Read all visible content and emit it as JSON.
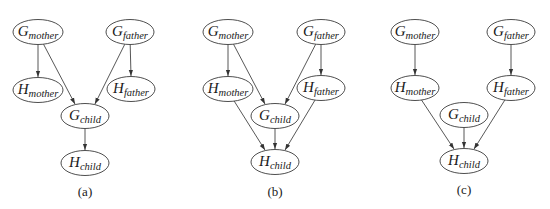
{
  "style": {
    "node_stroke": "#3a3a3a",
    "edge_color": "#444444",
    "background": "#ffffff"
  },
  "panels": [
    {
      "caption": "(a)",
      "caption_pos": [
        85,
        196
      ],
      "nodes": [
        {
          "id": "G_mother",
          "main": "G",
          "sub": "mother",
          "cx": 38,
          "cy": 32,
          "rx": 25,
          "ry": 12.5
        },
        {
          "id": "G_father",
          "main": "G",
          "sub": "father",
          "cx": 130,
          "cy": 32,
          "rx": 24,
          "ry": 12.5
        },
        {
          "id": "H_mother",
          "main": "H",
          "sub": "mother",
          "cx": 38,
          "cy": 90,
          "rx": 25,
          "ry": 12.5
        },
        {
          "id": "H_father",
          "main": "H",
          "sub": "father",
          "cx": 131,
          "cy": 89,
          "rx": 24,
          "ry": 12.5
        },
        {
          "id": "G_child",
          "main": "G",
          "sub": "child",
          "cx": 85,
          "cy": 116,
          "rx": 24,
          "ry": 12.5
        },
        {
          "id": "H_child",
          "main": "H",
          "sub": "child",
          "cx": 85,
          "cy": 163,
          "rx": 24,
          "ry": 12.5
        }
      ],
      "edges": [
        [
          "G_mother",
          "H_mother"
        ],
        [
          "G_father",
          "H_father"
        ],
        [
          "G_mother",
          "G_child"
        ],
        [
          "G_father",
          "G_child"
        ],
        [
          "G_child",
          "H_child"
        ]
      ]
    },
    {
      "caption": "(b)",
      "caption_pos": [
        275,
        196
      ],
      "nodes": [
        {
          "id": "G_mother",
          "main": "G",
          "sub": "mother",
          "cx": 228,
          "cy": 32,
          "rx": 25,
          "ry": 12.5
        },
        {
          "id": "G_father",
          "main": "G",
          "sub": "father",
          "cx": 321,
          "cy": 32,
          "rx": 24,
          "ry": 12.5
        },
        {
          "id": "H_mother",
          "main": "H",
          "sub": "mother",
          "cx": 228,
          "cy": 89,
          "rx": 25,
          "ry": 12.5
        },
        {
          "id": "H_father",
          "main": "H",
          "sub": "father",
          "cx": 321,
          "cy": 88,
          "rx": 24,
          "ry": 12.5
        },
        {
          "id": "G_child",
          "main": "G",
          "sub": "child",
          "cx": 275,
          "cy": 116,
          "rx": 24,
          "ry": 12.5
        },
        {
          "id": "H_child",
          "main": "H",
          "sub": "child",
          "cx": 275,
          "cy": 162,
          "rx": 24,
          "ry": 12.5
        }
      ],
      "edges": [
        [
          "G_mother",
          "H_mother"
        ],
        [
          "G_father",
          "H_father"
        ],
        [
          "G_mother",
          "G_child"
        ],
        [
          "G_father",
          "G_child"
        ],
        [
          "H_mother",
          "H_child"
        ],
        [
          "G_child",
          "H_child"
        ],
        [
          "H_father",
          "H_child"
        ]
      ]
    },
    {
      "caption": "(c)",
      "caption_pos": [
        464,
        194
      ],
      "nodes": [
        {
          "id": "G_mother",
          "main": "G",
          "sub": "mother",
          "cx": 415,
          "cy": 32,
          "rx": 24,
          "ry": 12.5
        },
        {
          "id": "G_father",
          "main": "G",
          "sub": "father",
          "cx": 511,
          "cy": 32,
          "rx": 24,
          "ry": 12.5
        },
        {
          "id": "H_mother",
          "main": "H",
          "sub": "mother",
          "cx": 415,
          "cy": 88,
          "rx": 24,
          "ry": 12.5
        },
        {
          "id": "H_father",
          "main": "H",
          "sub": "father",
          "cx": 511,
          "cy": 88,
          "rx": 24,
          "ry": 12.5
        },
        {
          "id": "G_child",
          "main": "G",
          "sub": "child",
          "cx": 464,
          "cy": 115,
          "rx": 24,
          "ry": 12.5
        },
        {
          "id": "H_child",
          "main": "H",
          "sub": "child",
          "cx": 464,
          "cy": 161,
          "rx": 24,
          "ry": 12.5
        }
      ],
      "edges": [
        [
          "G_mother",
          "H_mother"
        ],
        [
          "G_father",
          "H_father"
        ],
        [
          "H_mother",
          "H_child"
        ],
        [
          "G_child",
          "H_child"
        ],
        [
          "H_father",
          "H_child"
        ]
      ]
    }
  ]
}
